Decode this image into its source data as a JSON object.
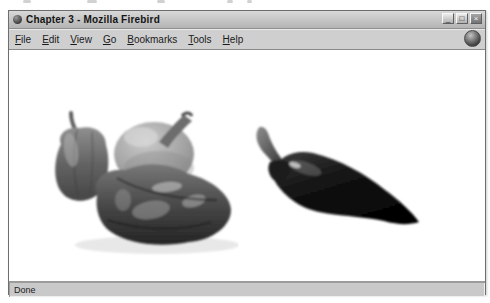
{
  "window": {
    "title": "Chapter 3 - Mozilla Firebird",
    "controls": [
      {
        "id": "minimize",
        "glyph": "_"
      },
      {
        "id": "maximize",
        "glyph": "□"
      },
      {
        "id": "close",
        "glyph": "×"
      }
    ],
    "menu_items": [
      {
        "label": "File",
        "underline": 0
      },
      {
        "label": "Edit",
        "underline": 0
      },
      {
        "label": "View",
        "underline": 0
      },
      {
        "label": "Go",
        "underline": 0
      },
      {
        "label": "Bookmarks",
        "underline": 0
      },
      {
        "label": "Tools",
        "underline": 0
      },
      {
        "label": "Help",
        "underline": 0
      }
    ],
    "status_text": "Done"
  },
  "content": {
    "images": [
      {
        "name": "bell-peppers-photo",
        "description": "three bell peppers, grayscale photo"
      },
      {
        "name": "chili-pepper-photo",
        "description": "single dark chili pepper, grayscale photo"
      }
    ]
  },
  "colors": {
    "chrome_gray": "#c9c9c9",
    "window_border": "#6e6e6e",
    "content_bg": "#ffffff",
    "text": "#1a1a1a"
  }
}
